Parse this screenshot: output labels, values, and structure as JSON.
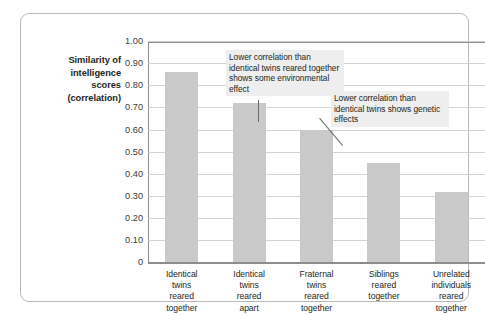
{
  "chart_data": {
    "type": "bar",
    "title": "",
    "subtitle": "",
    "xlabel": "",
    "ylabel": "Similarity of intelligence scores (correlation)",
    "ylim": [
      0,
      1.0
    ],
    "grid": true,
    "legend": "none",
    "categories": [
      "Identical twins reared together",
      "Identical twins reared apart",
      "Fraternal twins reared together",
      "Siblings reared together",
      "Unrelated individuals reared together"
    ],
    "values": [
      0.86,
      0.72,
      0.6,
      0.45,
      0.32
    ],
    "ytick_labels": [
      "1.00",
      "0.90",
      "0.80",
      "0.70",
      "0.60",
      "0.50",
      "0.40",
      "0.30",
      "0.20",
      "0.10",
      "0"
    ],
    "ytick_values": [
      1.0,
      0.9,
      0.8,
      0.7,
      0.6,
      0.5,
      0.4,
      0.3,
      0.2,
      0.1,
      0
    ],
    "annotations": [
      {
        "text": "Lower correlation than identical twins reared together shows some environmental effect",
        "points_to_category": "Identical twins reared apart"
      },
      {
        "text": "Lower correlation than identical twins shows genetic effects",
        "points_to_category": "Fraternal twins reared together"
      }
    ],
    "colors": {
      "bar": "#c9c9c9",
      "gridline": "#d2d2d2",
      "axis": "#8d8d8d",
      "annotation_background": "#eeeeee",
      "text": "#231f20",
      "frame_border": "#b9b9b9"
    }
  },
  "axis": {
    "y_title_lines": [
      "Similarity of",
      "intelligence",
      "scores",
      "(correlation)"
    ]
  },
  "categories_lines": [
    [
      "Identical",
      "twins",
      "reared",
      "together"
    ],
    [
      "Identical",
      "twins",
      "reared",
      "apart"
    ],
    [
      "Fraternal",
      "twins",
      "reared",
      "together"
    ],
    [
      "Siblings",
      "reared",
      "together"
    ],
    [
      "Unrelated",
      "individuals",
      "reared",
      "together"
    ]
  ]
}
